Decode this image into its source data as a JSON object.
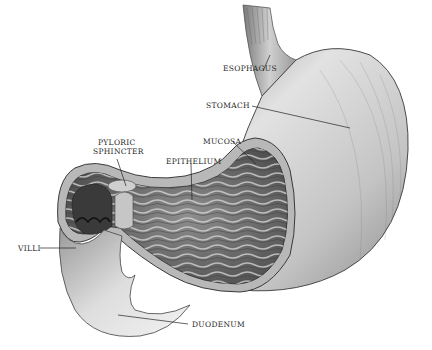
{
  "figure": {
    "labels": [
      {
        "id": "esophagus",
        "text": "ESOPHAGUS",
        "x": 225,
        "y": 68
      },
      {
        "id": "stomach",
        "text": "STOMACH",
        "x": 205,
        "y": 102
      },
      {
        "id": "mucosa",
        "text": "MUCOSA",
        "x": 203,
        "y": 137
      },
      {
        "id": "pyloric",
        "text": "PYLORIC",
        "x": 97,
        "y": 140
      },
      {
        "id": "sphincter",
        "text": "SPHINCTER",
        "x": 94,
        "y": 149
      },
      {
        "id": "epithelium",
        "text": "EPITHELIUM",
        "x": 166,
        "y": 159
      },
      {
        "id": "villi",
        "text": "VILLI",
        "x": 18,
        "y": 245
      },
      {
        "id": "duodenum",
        "text": "DUODENUM",
        "x": 192,
        "y": 323
      }
    ]
  }
}
